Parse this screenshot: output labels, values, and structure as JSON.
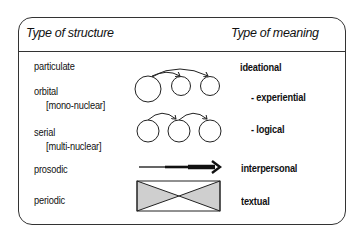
{
  "header": {
    "structure_title": "Type of structure",
    "meaning_title": "Type of meaning"
  },
  "rows": [
    {
      "structure": "particulate",
      "sub": "",
      "meaning": "ideational",
      "diagram": "none"
    },
    {
      "structure": "orbital",
      "sub": "[mono-nuclear]",
      "meaning": "- experiential",
      "diagram": "nucleus-satellite-arcs-icon"
    },
    {
      "structure": "serial",
      "sub": "[multi-nuclear]",
      "meaning": "- logical",
      "diagram": "chained-circles-arcs-icon"
    },
    {
      "structure": "prosodic",
      "sub": "",
      "meaning": "interpersonal",
      "diagram": "thickening-arrow-icon"
    },
    {
      "structure": "periodic",
      "sub": "",
      "meaning": "textual",
      "diagram": "hourglass-rectangle-icon"
    }
  ],
  "colors": {
    "line": "#222222",
    "fill": "#cfcfcf"
  }
}
